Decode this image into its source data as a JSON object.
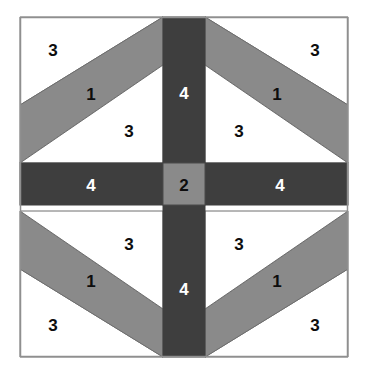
{
  "figure": {
    "name": "quilt-block-piecing-diagram",
    "canvas": {
      "width": 367,
      "height": 385
    },
    "frame": {
      "x": 20,
      "y": 17,
      "width": 328,
      "height": 340
    }
  },
  "colors": {
    "background": "#ffffff",
    "fabric_white": "#ffffff",
    "fabric_medium_gray": "#8a8a8a",
    "fabric_dark_gray": "#3e3e3e",
    "outline": "#6e6e6e",
    "frame_stroke": "#8f8f8f",
    "label_dark": "#0d0d0d",
    "label_light": "#ffffff"
  },
  "geometry": {
    "frame_left": 20,
    "frame_top": 17,
    "frame_right": 348,
    "frame_bottom": 357,
    "cross_left": 163,
    "cross_right": 205,
    "cross_top": 163,
    "cross_bottom": 205,
    "strip_offset": 58
  },
  "legend": {
    "piece_1": "1",
    "piece_2": "2",
    "piece_3": "3",
    "piece_4": "4"
  },
  "pieces": {
    "strips": [
      {
        "id": "strip-top-left",
        "label": "1",
        "quadrant": "top-left"
      },
      {
        "id": "strip-top-right",
        "label": "1",
        "quadrant": "top-right"
      },
      {
        "id": "strip-bottom-left",
        "label": "1",
        "quadrant": "bottom-left"
      },
      {
        "id": "strip-bottom-right",
        "label": "1",
        "quadrant": "bottom-right"
      }
    ],
    "center": {
      "id": "center-square",
      "label": "2"
    },
    "bars": [
      {
        "id": "bar-top",
        "label": "4",
        "orientation": "vertical"
      },
      {
        "id": "bar-left",
        "label": "4",
        "orientation": "horizontal"
      },
      {
        "id": "bar-right",
        "label": "4",
        "orientation": "horizontal"
      },
      {
        "id": "bar-bottom",
        "label": "4",
        "orientation": "vertical"
      }
    ],
    "triangles": [
      {
        "id": "tri-tl-outer",
        "label": "3",
        "quadrant": "top-left",
        "position": "outer"
      },
      {
        "id": "tri-tl-inner",
        "label": "3",
        "quadrant": "top-left",
        "position": "inner"
      },
      {
        "id": "tri-tr-outer",
        "label": "3",
        "quadrant": "top-right",
        "position": "outer"
      },
      {
        "id": "tri-tr-inner",
        "label": "3",
        "quadrant": "top-right",
        "position": "inner"
      },
      {
        "id": "tri-bl-outer",
        "label": "3",
        "quadrant": "bottom-left",
        "position": "outer"
      },
      {
        "id": "tri-bl-inner",
        "label": "3",
        "quadrant": "bottom-left",
        "position": "inner"
      },
      {
        "id": "tri-br-outer",
        "label": "3",
        "quadrant": "bottom-right",
        "position": "outer"
      },
      {
        "id": "tri-br-inner",
        "label": "3",
        "quadrant": "bottom-right",
        "position": "inner"
      }
    ]
  },
  "labels": {
    "tl_outer_3": "3",
    "tl_strip_1": "1",
    "tl_inner_3": "3",
    "tr_outer_3": "3",
    "tr_strip_1": "1",
    "tr_inner_3": "3",
    "bl_outer_3": "3",
    "bl_strip_1": "1",
    "bl_inner_3": "3",
    "br_outer_3": "3",
    "br_strip_1": "1",
    "br_inner_3": "3",
    "bar_top_4": "4",
    "bar_left_4": "4",
    "bar_right_4": "4",
    "bar_bottom_4": "4",
    "center_2": "2"
  }
}
